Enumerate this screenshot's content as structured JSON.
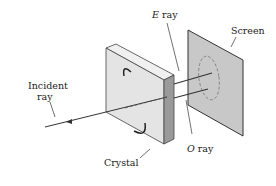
{
  "labels": {
    "e_ray_letter": "E",
    "e_ray_word": "ray",
    "screen": "Screen",
    "incident_line1": "Incident",
    "incident_line2": "ray",
    "crystal": "Crystal",
    "o_ray_letter": "O",
    "o_ray_word": "ray"
  },
  "colors": {
    "line": "#333333",
    "screen_fill": "#c8c8c8",
    "crystal_face": "#e4e4e4",
    "crystal_side": "#9a9a9a",
    "crystal_top": "#f0f0f0"
  }
}
